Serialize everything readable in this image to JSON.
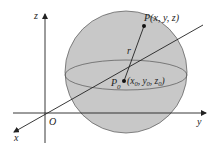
{
  "diagram": {
    "axes": {
      "x_label": "x",
      "y_label": "y",
      "z_label": "z",
      "origin_label": "O"
    },
    "points": {
      "P_label": "P(x, y, z)",
      "P0_name": "P",
      "P0_sub": "0",
      "P0_coords_open": "(x",
      "P0_coords_x_sub": "0",
      "P0_coords_y": ", y",
      "P0_coords_y_sub": "0",
      "P0_coords_z": ", z",
      "P0_coords_z_sub": "0",
      "P0_coords_close": ")"
    },
    "radius_label": "r",
    "colors": {
      "sphere_fill": "#c8c8c8",
      "sphere_stroke": "#555555",
      "axis": "#222222",
      "background": "#ffffff"
    }
  }
}
